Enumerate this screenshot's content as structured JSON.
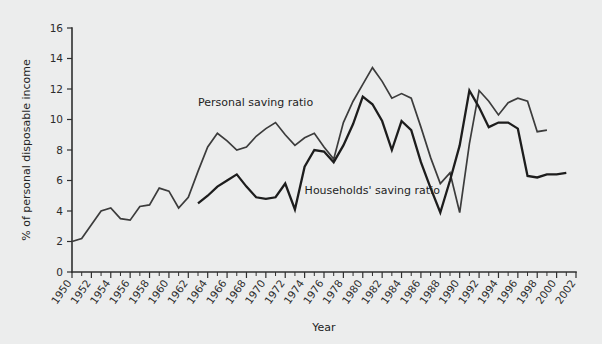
{
  "chart_data": {
    "type": "line",
    "title": "",
    "xlabel": "Year",
    "ylabel": "% of personal disposable income",
    "xlim": [
      1950,
      2002
    ],
    "ylim": [
      0,
      16
    ],
    "ytick_step": 2,
    "xtick_step": 2,
    "xminor_step": 1,
    "grid": false,
    "legend": "inline-annotations",
    "background_color": "#eceded",
    "yticks": [
      "0",
      "2",
      "4",
      "6",
      "8",
      "10",
      "12",
      "14",
      "16"
    ],
    "xticks": [
      "1950",
      "1952",
      "1954",
      "1956",
      "1958",
      "1960",
      "1962",
      "1964",
      "1966",
      "1968",
      "1970",
      "1972",
      "1974",
      "1976",
      "1978",
      "1980",
      "1982",
      "1984",
      "1986",
      "1988",
      "1990",
      "1992",
      "1994",
      "1996",
      "1998",
      "2000",
      "2002"
    ],
    "series": [
      {
        "name": "Personal saving ratio",
        "color": "#3c3c3c",
        "label_x": 1963.0,
        "label_y": 10.9,
        "x": [
          1950,
          1951,
          1952,
          1953,
          1954,
          1955,
          1956,
          1957,
          1958,
          1959,
          1960,
          1961,
          1962,
          1963,
          1964,
          1965,
          1966,
          1967,
          1968,
          1969,
          1970,
          1971,
          1972,
          1973,
          1974,
          1975,
          1976,
          1977,
          1978,
          1979,
          1980,
          1981,
          1982,
          1983,
          1984,
          1985,
          1986,
          1987,
          1988,
          1989,
          1990,
          1991,
          1992,
          1993,
          1994,
          1995,
          1996,
          1997,
          1998,
          1999
        ],
        "values": [
          2.0,
          2.2,
          3.1,
          4.0,
          4.2,
          3.5,
          3.4,
          4.3,
          4.4,
          5.5,
          5.3,
          4.2,
          4.9,
          6.6,
          8.2,
          9.1,
          8.6,
          8.0,
          8.2,
          8.9,
          9.4,
          9.8,
          9.0,
          8.3,
          8.8,
          9.1,
          8.2,
          7.4,
          9.8,
          11.2,
          12.3,
          13.4,
          12.5,
          11.4,
          11.7,
          11.4,
          9.5,
          7.5,
          5.8,
          6.5,
          3.9,
          8.4,
          11.9,
          11.2,
          10.3,
          11.1,
          11.4,
          11.2,
          9.2,
          9.3
        ]
      },
      {
        "name": "Households' saving ratio",
        "color": "#1d1d1d",
        "label_x": 1974.0,
        "label_y": 5.1,
        "x": [
          1963,
          1964,
          1965,
          1966,
          1967,
          1968,
          1969,
          1970,
          1971,
          1972,
          1973,
          1974,
          1975,
          1976,
          1977,
          1978,
          1979,
          1980,
          1981,
          1982,
          1983,
          1984,
          1985,
          1986,
          1987,
          1988,
          1989,
          1990,
          1991,
          1992,
          1993,
          1994,
          1995,
          1996,
          1997,
          1998,
          1999,
          2000,
          2001
        ],
        "values": [
          4.5,
          5.0,
          5.6,
          6.0,
          6.4,
          5.6,
          4.9,
          4.8,
          4.9,
          5.8,
          4.1,
          6.9,
          8.0,
          7.9,
          7.2,
          8.3,
          9.7,
          11.5,
          11.0,
          9.9,
          8.0,
          9.9,
          9.3,
          7.2,
          5.5,
          3.9,
          6.0,
          8.3,
          11.9,
          10.8,
          9.5,
          9.8,
          9.8,
          9.4,
          6.3,
          6.2,
          6.4,
          6.4,
          6.5
        ]
      }
    ],
    "annotations": [
      {
        "text": "Personal saving ratio",
        "x": 1963.0,
        "y": 10.9
      },
      {
        "text": "Households' saving ratio",
        "x": 1974.0,
        "y": 5.1
      }
    ]
  },
  "axes": {
    "x_title": "Year",
    "y_title": "% of personal disposable income"
  }
}
